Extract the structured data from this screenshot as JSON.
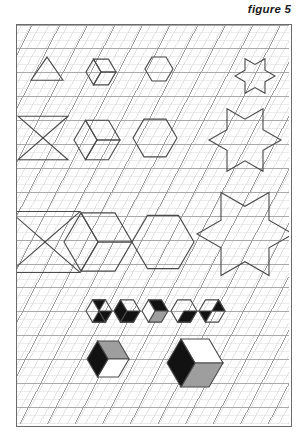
{
  "figure": {
    "caption": "figure 5",
    "caption_style": "italic-bold"
  },
  "plate": {
    "frame": {
      "x": 16,
      "y": 24,
      "width": 274,
      "height": 401,
      "border_color": "#6b6b6b"
    },
    "background_color": "#fefefe"
  },
  "grid": {
    "type": "isometric-triangular",
    "fine": {
      "spacing_px": 9.2,
      "color": "#d9d9d9",
      "stroke_width": 0.5,
      "description": "fine triangular lattice covering the whole plate"
    },
    "coarse": {
      "spacing_px": 27.6,
      "color": "#9a9a9a",
      "stroke_width": 0.8,
      "description": "coarse triangular lattice, every third fine line"
    }
  },
  "shape_stroke_color": "#4a4a4a",
  "shape_stroke_width": 1.1,
  "fills": {
    "black": "#121212",
    "gray": "#9e9e9e",
    "white": "#ffffff"
  },
  "rows": [
    {
      "name": "row-1-unit-scale",
      "scale_units": 1,
      "shapes": [
        {
          "name": "triangle",
          "kind": "triangle",
          "cx": 47,
          "cy": 71,
          "size": 16,
          "fill": "none"
        },
        {
          "name": "cube-outline",
          "kind": "cube",
          "cx": 101,
          "cy": 72,
          "size": 15,
          "fill": "none"
        },
        {
          "name": "hexagon",
          "kind": "hexagon",
          "cx": 159,
          "cy": 69,
          "size": 14,
          "fill": "none"
        },
        {
          "name": "hexagram",
          "kind": "star6",
          "cx": 255,
          "cy": 76,
          "size": 20,
          "fill": "none"
        }
      ]
    },
    {
      "name": "row-2-double-scale",
      "scale_units": 2,
      "shapes": [
        {
          "name": "triangle",
          "kind": "triangle-pair",
          "cx": 43,
          "cy": 138,
          "size": 25,
          "fill": "none"
        },
        {
          "name": "cube-outline",
          "kind": "cube",
          "cx": 97,
          "cy": 140,
          "size": 23,
          "fill": "none"
        },
        {
          "name": "hexagon",
          "kind": "hexagon",
          "cx": 155,
          "cy": 138,
          "size": 22,
          "fill": "none"
        },
        {
          "name": "hexagram",
          "kind": "star6",
          "cx": 245,
          "cy": 140,
          "size": 36,
          "fill": "none"
        }
      ]
    },
    {
      "name": "row-3-triple-scale",
      "scale_units": 3,
      "shapes": [
        {
          "name": "triangle",
          "cx": 45,
          "cy": 242,
          "kind": "triangle-pair",
          "size": 35,
          "fill": "none"
        },
        {
          "name": "cube-outline",
          "kind": "cube",
          "cx": 98,
          "cy": 242,
          "size": 34,
          "fill": "none"
        },
        {
          "name": "hexagon",
          "kind": "hexagon",
          "cx": 163,
          "cy": 242,
          "size": 31,
          "fill": "none"
        },
        {
          "name": "hexagram",
          "kind": "star6",
          "cx": 245,
          "cy": 234,
          "size": 48,
          "fill": "none"
        }
      ]
    },
    {
      "name": "row-4-small-filled",
      "scale_units": 1,
      "shapes": [
        {
          "name": "hexagon-three-black-triangles",
          "kind": "hexagon-tri3",
          "cx": 99,
          "cy": 311,
          "size": 13,
          "fill": "black-3-corners"
        },
        {
          "name": "hexagon-two-black-rhombi",
          "kind": "hexagon-rh2",
          "cx": 127,
          "cy": 311,
          "size": 13,
          "fill": "black-left-right"
        },
        {
          "name": "cube-black-top",
          "kind": "cube-shaded",
          "cx": 155,
          "cy": 311,
          "size": 13,
          "fill": "top-black-right-gray"
        },
        {
          "name": "hexagon-one-black-rhombus",
          "kind": "hexagon-rh1",
          "cx": 184,
          "cy": 311,
          "size": 13,
          "fill": "black-right"
        },
        {
          "name": "hexagon-black-triangles",
          "kind": "hexagon-tri-alt",
          "cx": 212,
          "cy": 311,
          "size": 13,
          "fill": "black-alt"
        }
      ]
    },
    {
      "name": "row-5-large-filled-cubes",
      "scale_units": 2,
      "shapes": [
        {
          "name": "cube-black-left-gray-top",
          "kind": "cube-shaded",
          "cx": 108,
          "cy": 359,
          "size": 21,
          "fill": "left-black-top-gray-right-white"
        },
        {
          "name": "cube-black-left-gray-right",
          "kind": "cube-shaded",
          "cx": 195,
          "cy": 363,
          "size": 28,
          "fill": "left-black-right-gray-top-white"
        }
      ]
    }
  ]
}
